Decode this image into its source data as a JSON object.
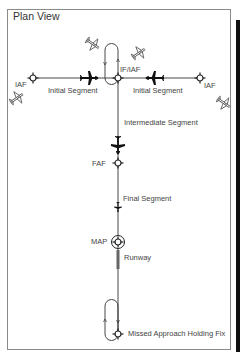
{
  "diagram": {
    "title": "Plan View",
    "labels": {
      "iaf_left": "IAF",
      "iaf_right": "IAF",
      "if_iaf": "IF/IAF",
      "initial_segment_left": "Initial Segment",
      "initial_segment_right": "Initial Segment",
      "intermediate_segment": "Intermediate Segment",
      "faf": "FAF",
      "final_segment": "Final Segment",
      "map": "MAP",
      "runway": "Runway",
      "missed_approach_holding_fix": "Missed Approach Holding Fix"
    },
    "nodes": [
      {
        "id": "iaf_left",
        "type": "fix",
        "x": 33,
        "y": 78
      },
      {
        "id": "if_iaf",
        "type": "fix",
        "x": 118,
        "y": 78
      },
      {
        "id": "iaf_right",
        "type": "fix",
        "x": 200,
        "y": 78
      },
      {
        "id": "faf",
        "type": "fix",
        "x": 118,
        "y": 163
      },
      {
        "id": "map",
        "type": "fix-circled",
        "x": 118,
        "y": 242
      },
      {
        "id": "mahf",
        "type": "fix",
        "x": 118,
        "y": 334
      }
    ],
    "edges": [
      {
        "from": "iaf_left",
        "to": "if_iaf",
        "label": "Initial Segment"
      },
      {
        "from": "iaf_right",
        "to": "if_iaf",
        "label": "Initial Segment"
      },
      {
        "from": "if_iaf",
        "to": "faf",
        "label": "Intermediate Segment"
      },
      {
        "from": "faf",
        "to": "map",
        "label": "Final Segment"
      },
      {
        "from": "map",
        "to": "mahf",
        "label": ""
      }
    ],
    "holding_patterns": [
      "if_iaf",
      "mahf"
    ],
    "colors": {
      "line": "#333333",
      "text": "#444444",
      "frame": "#8a8a8a"
    }
  }
}
